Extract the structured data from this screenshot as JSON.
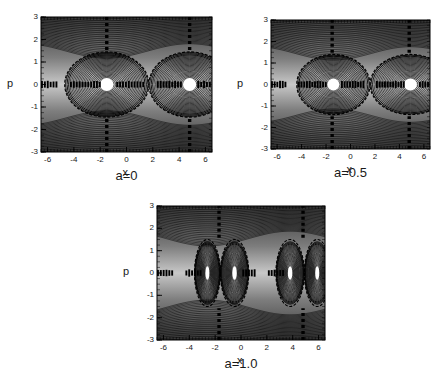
{
  "figure": {
    "type": "multi-panel-contour-figure",
    "panel_count": 3,
    "background_color": "#ffffff",
    "text_color": "#1a1a1a"
  },
  "chart_data": [
    {
      "type": "heatmap",
      "title": "a=0",
      "caption": "a=0",
      "xlabel": "x",
      "ylabel": "p",
      "xlim": [
        -6.5,
        6.5
      ],
      "ylim": [
        -3,
        3
      ],
      "xticks": [
        -6,
        -4,
        -2,
        0,
        2,
        4,
        6
      ],
      "xticklabels": [
        "-6",
        "-4",
        "-2",
        "0",
        "2",
        "4",
        "6"
      ],
      "yticks": [
        -3,
        -2,
        -1,
        0,
        1,
        2,
        3
      ],
      "yticklabels": [
        "-3",
        "-2",
        "-1",
        "0",
        "1",
        "2",
        "3"
      ],
      "grid": false,
      "legend": "none",
      "colormap": "grayscale",
      "description": "Phase-space contour plot with shaded grayscale background; concentric closed orbits around elliptic fixed points with separatrices through hyperbolic X-points.",
      "elliptic_points": [
        {
          "x": -1.5,
          "p": 0
        },
        {
          "x": 4.8,
          "p": 0
        }
      ],
      "hyperbolic_points": [
        {
          "x": -4.8,
          "p": 0
        },
        {
          "x": 1.7,
          "p": 0
        }
      ],
      "separatrix_half_height": 1.45,
      "island_half_width": 3.2,
      "vertical_separatrix_x": [
        -1.5,
        4.8
      ],
      "island_split": false,
      "contour_levels": 26
    },
    {
      "type": "heatmap",
      "title": "a=0.5",
      "caption": "a=0.5",
      "xlabel": "x",
      "ylabel": "p",
      "xlim": [
        -6.5,
        6.5
      ],
      "ylim": [
        -3,
        3
      ],
      "xticks": [
        -6,
        -4,
        -2,
        0,
        2,
        4,
        6
      ],
      "xticklabels": [
        "-6",
        "-4",
        "-2",
        "0",
        "2",
        "4",
        "6"
      ],
      "yticks": [
        -3,
        -2,
        -1,
        0,
        1,
        2,
        3
      ],
      "yticklabels": [
        "-3",
        "-2",
        "-1",
        "0",
        "1",
        "2",
        "3"
      ],
      "grid": false,
      "legend": "none",
      "colormap": "grayscale",
      "description": "Phase-space contour plot at a=0.5; central islands are enlarged and flattened compared with a=0, separatrix lobes broader.",
      "elliptic_points": [
        {
          "x": -1.4,
          "p": 0
        },
        {
          "x": 4.9,
          "p": 0
        }
      ],
      "hyperbolic_points": [
        {
          "x": -4.9,
          "p": 0
        },
        {
          "x": 1.6,
          "p": 0
        }
      ],
      "separatrix_half_height": 1.4,
      "island_half_width": 3.3,
      "vertical_separatrix_x": [
        -1.5,
        4.8
      ],
      "island_split": false,
      "contour_levels": 24
    },
    {
      "type": "heatmap",
      "title": "a=1.0",
      "caption": "a=1.0",
      "xlabel": "x",
      "ylabel": "p",
      "xlim": [
        -6.5,
        6.5
      ],
      "ylim": [
        -3,
        3
      ],
      "xticks": [
        -6,
        -4,
        -2,
        0,
        2,
        4,
        6
      ],
      "xticklabels": [
        "-6",
        "-4",
        "-2",
        "0",
        "2",
        "4",
        "6"
      ],
      "yticks": [
        -3,
        -2,
        -1,
        0,
        1,
        2,
        3
      ],
      "yticklabels": [
        "-3",
        "-2",
        "-1",
        "0",
        "1",
        "2",
        "3"
      ],
      "grid": false,
      "legend": "none",
      "colormap": "grayscale",
      "description": "Phase-space contour plot at a=1.0; each primary island has bifurcated into a pair of smaller islands separated by a new X-point, producing figure-eight separatrices.",
      "elliptic_points": [
        {
          "x": -2.6,
          "p": 0
        },
        {
          "x": -0.5,
          "p": 0
        },
        {
          "x": 3.8,
          "p": 0
        },
        {
          "x": 5.9,
          "p": 0
        }
      ],
      "hyperbolic_points": [
        {
          "x": -4.9,
          "p": 0
        },
        {
          "x": -1.6,
          "p": 0
        },
        {
          "x": 1.6,
          "p": 0
        },
        {
          "x": 4.9,
          "p": 0
        }
      ],
      "separatrix_half_height": 1.5,
      "island_half_width": 3.3,
      "vertical_separatrix_x": [
        -1.7,
        4.8
      ],
      "island_split": true,
      "contour_levels": 26
    }
  ]
}
